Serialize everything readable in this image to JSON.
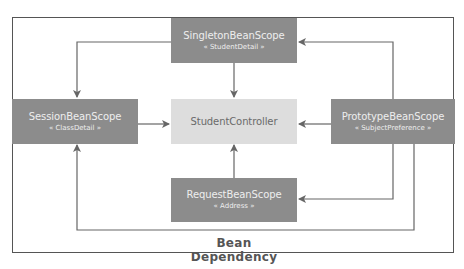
{
  "diagram": {
    "caption": "Bean Dependency",
    "colors": {
      "scope_box": "#8c8c8c",
      "controller_box": "#dddddd",
      "edge": "#666666",
      "frame": "#555555"
    },
    "nodes": {
      "singleton": {
        "name": "SingletonBeanScope",
        "stereotype": "« StudentDetail »"
      },
      "session": {
        "name": "SessionBeanScope",
        "stereotype": "« ClassDetail »"
      },
      "controller": {
        "name": "StudentController"
      },
      "prototype": {
        "name": "PrototypeBeanScope",
        "stereotype": "« SubjectPreference »"
      },
      "request": {
        "name": "RequestBeanScope",
        "stereotype": "« Address »"
      }
    },
    "edges": [
      {
        "from": "SingletonBeanScope",
        "to": "SessionBeanScope"
      },
      {
        "from": "SingletonBeanScope",
        "to": "StudentController"
      },
      {
        "from": "SessionBeanScope",
        "to": "StudentController"
      },
      {
        "from": "PrototypeBeanScope",
        "to": "StudentController"
      },
      {
        "from": "PrototypeBeanScope",
        "to": "SingletonBeanScope"
      },
      {
        "from": "PrototypeBeanScope",
        "to": "RequestBeanScope"
      },
      {
        "from": "PrototypeBeanScope",
        "to": "SessionBeanScope"
      },
      {
        "from": "RequestBeanScope",
        "to": "StudentController"
      }
    ]
  }
}
